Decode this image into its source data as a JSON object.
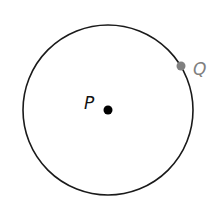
{
  "diagram": {
    "type": "circle",
    "circle": {
      "cx": 108,
      "cy": 110,
      "r": 85,
      "stroke": "#1a1a1a"
    },
    "points": [
      {
        "id": "P",
        "label": "P",
        "x": 108,
        "y": 110,
        "role": "center",
        "color": "#000000"
      },
      {
        "id": "Q",
        "label": "Q",
        "x": 181,
        "y": 66,
        "role": "on-circle",
        "color": "#808080"
      }
    ]
  }
}
